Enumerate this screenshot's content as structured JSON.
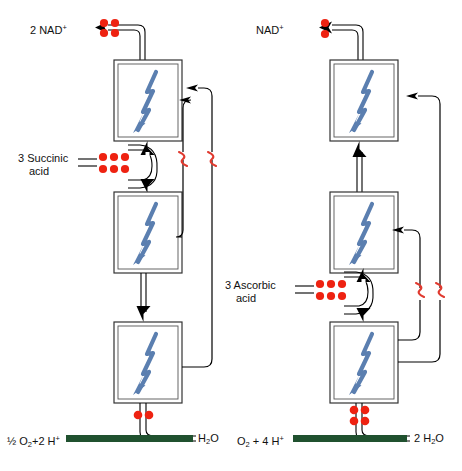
{
  "diagram": {
    "type": "biochemical-pathway",
    "colors": {
      "electron_dot": "#ee2211",
      "atp_squiggle": "#e03a2f",
      "bolt_arrow": "#5b7fb0",
      "substrate_arrow": "#20512f",
      "line": "#000000",
      "background": "#ffffff"
    }
  },
  "left_pathway": {
    "name": "NADH-linked pathway",
    "top_label": "2 NAD",
    "top_label_charge": "+",
    "top_electron_dots": 4,
    "substrate_label_line1": "3 Succinic",
    "substrate_label_line2": "acid",
    "substrate_electron_dots": 6,
    "complex_count": 3,
    "coupling_sites": 2,
    "coupling_symbol": "~",
    "bottom_electron_dots": 2,
    "bottom_reactant_prefix": "½ O",
    "bottom_reactant_sub": "2",
    "bottom_reactant_mid": "+2 H",
    "bottom_reactant_sup": "+",
    "bottom_product_prefix": "H",
    "bottom_product_sub": "2",
    "bottom_product_suffix": "O"
  },
  "right_pathway": {
    "name": "Ascorbate-linked pathway",
    "top_label": "NAD",
    "top_label_charge": "+",
    "top_electron_dots": 2,
    "substrate_label_line1": "3 Ascorbic",
    "substrate_label_line2": "acid",
    "substrate_electron_dots": 6,
    "complex_count": 3,
    "coupling_sites": 2,
    "coupling_symbol": "~",
    "bottom_electron_dots": 4,
    "bottom_reactant_prefix": "O",
    "bottom_reactant_sub": "2",
    "bottom_reactant_mid": " + 4 H",
    "bottom_reactant_sup": "+",
    "bottom_product_prefix": "2 H",
    "bottom_product_sub": "2",
    "bottom_product_suffix": "O"
  }
}
